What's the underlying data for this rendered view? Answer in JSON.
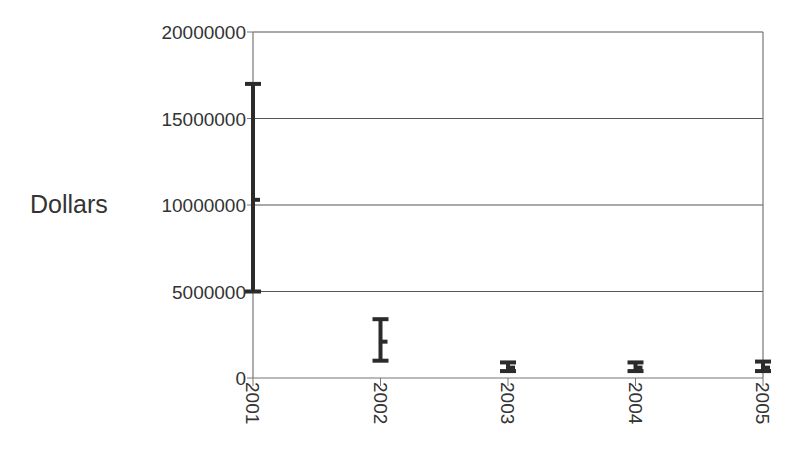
{
  "chart_data": {
    "type": "errorbar",
    "title": "",
    "xlabel": "",
    "ylabel": "Dollars",
    "categories": [
      "2001",
      "2002",
      "2003",
      "2004",
      "2005"
    ],
    "series": [
      {
        "name": "Dollars",
        "mean": [
          10300000,
          2100000,
          600000,
          600000,
          600000
        ],
        "lower": [
          5000000,
          1000000,
          400000,
          400000,
          400000
        ],
        "upper": [
          17000000,
          3400000,
          900000,
          900000,
          950000
        ]
      }
    ],
    "ylim": [
      0,
      20000000
    ],
    "yticks": [
      0,
      5000000,
      10000000,
      15000000,
      20000000
    ],
    "ytick_labels": [
      "0",
      "5000000",
      "10000000",
      "15000000",
      "20000000"
    ],
    "grid": {
      "horizontal": true,
      "vertical": false
    },
    "legend": null
  },
  "colors": {
    "bar": "#2b2b2b",
    "axis": "#777777",
    "grid": "#555555",
    "text": "#333333"
  }
}
